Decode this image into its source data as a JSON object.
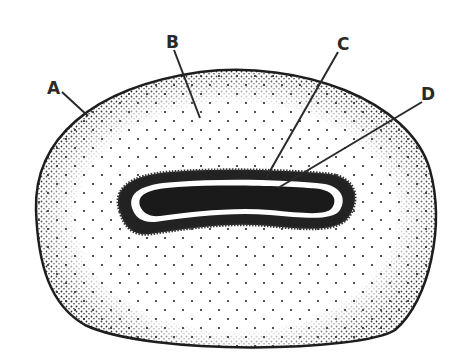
{
  "diagram": {
    "type": "cell-illustration",
    "colors": {
      "background": "#ffffff",
      "ink": "#1e1e1e",
      "stipple": "#2a2a2a",
      "nucleus_fill": "#1a1a1a"
    },
    "labels": [
      {
        "id": "A",
        "text": "A",
        "x": 53,
        "y": 94,
        "line": [
          62,
          92,
          88,
          116
        ]
      },
      {
        "id": "B",
        "text": "B",
        "x": 174,
        "y": 48,
        "line": [
          174,
          50,
          200,
          118
        ]
      },
      {
        "id": "C",
        "text": "C",
        "x": 343,
        "y": 50,
        "line": [
          338,
          52,
          266,
          178
        ]
      },
      {
        "id": "D",
        "text": "D",
        "x": 428,
        "y": 100,
        "line": [
          422,
          102,
          278,
          188
        ]
      }
    ]
  }
}
